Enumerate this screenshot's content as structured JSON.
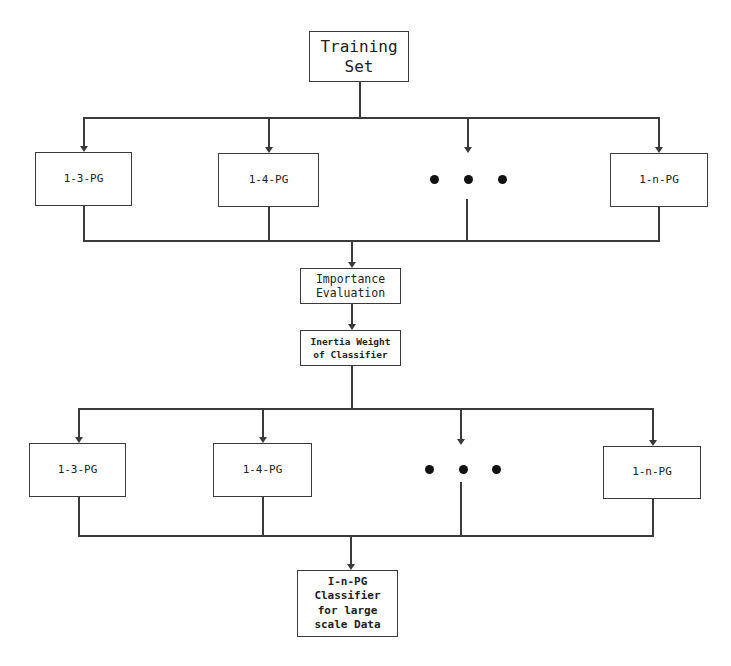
{
  "diagram": {
    "title_box": {
      "lines": [
        "Training",
        "Set"
      ]
    },
    "stage1": {
      "boxes": [
        {
          "label": "1-3-PG"
        },
        {
          "label": "1-4-PG"
        },
        {
          "label": "1-n-PG"
        }
      ],
      "ellipsis": "• • •"
    },
    "importance_box": {
      "lines": [
        "Importance",
        "Evaluation"
      ]
    },
    "weight_box": {
      "lines": [
        "Inertia Weight",
        "of Classifier"
      ]
    },
    "stage2": {
      "boxes": [
        {
          "label": "1-3-PG"
        },
        {
          "label": "1-4-PG"
        },
        {
          "label": "1-n-PG"
        }
      ],
      "ellipsis": "• • •"
    },
    "final_box": {
      "lines": [
        "I-n-PG",
        "Classifier",
        "for large",
        "scale Data"
      ]
    },
    "colors": {
      "line": "#3a3a3a",
      "text": "#222222",
      "background": "#ffffff"
    }
  }
}
